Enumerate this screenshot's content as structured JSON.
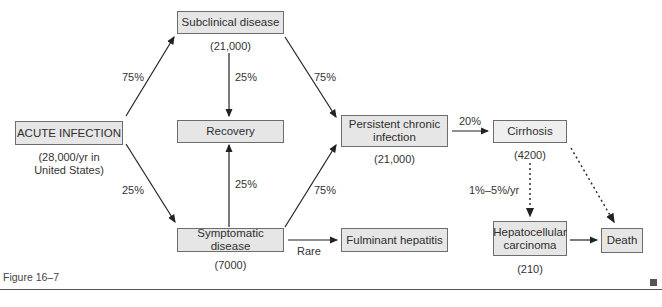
{
  "nodes": {
    "acute": {
      "label": "ACUTE INFECTION",
      "count_line1": "(28,000/yr in",
      "count_line2": "United States)"
    },
    "subclinical": {
      "label": "Subclinical disease",
      "count": "(21,000)"
    },
    "recovery": {
      "label": "Recovery"
    },
    "symptomatic": {
      "label": "Symptomatic disease",
      "count": "(7000)"
    },
    "persistent": {
      "label_line1": "Persistent chronic",
      "label_line2": "infection",
      "count": "(21,000)"
    },
    "fulminant": {
      "label": "Fulminant hepatitis"
    },
    "cirrhosis": {
      "label": "Cirrhosis",
      "count": "(4200)"
    },
    "hcc": {
      "label_line1": "Hepatocellular",
      "label_line2": "carcinoma",
      "count": "(210)"
    },
    "death": {
      "label": "Death"
    }
  },
  "edges": {
    "acute_to_subclinical": "75%",
    "acute_to_symptomatic": "25%",
    "subclinical_to_recovery": "25%",
    "symptomatic_to_recovery": "25%",
    "subclinical_to_persistent": "75%",
    "symptomatic_to_persistent": "75%",
    "symptomatic_to_fulminant": "Rare",
    "persistent_to_cirrhosis": "20%",
    "cirrhosis_to_hcc": "1%–5%/yr"
  },
  "caption": {
    "figure_label": "Figure 16–7"
  }
}
